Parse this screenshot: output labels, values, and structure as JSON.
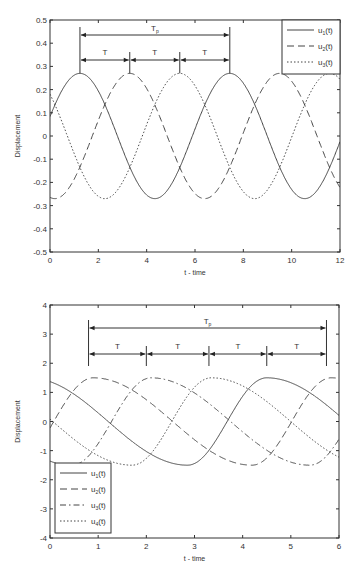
{
  "chart_data": [
    {
      "type": "line",
      "title": "",
      "xlabel": "t - time",
      "ylabel": "Displacement",
      "xlim": [
        0,
        12
      ],
      "ylim": [
        -0.5,
        0.5
      ],
      "xticks": [
        0,
        2,
        4,
        6,
        8,
        10,
        12
      ],
      "yticks": [
        -0.5,
        -0.4,
        -0.3,
        -0.2,
        -0.1,
        0,
        0.1,
        0.2,
        0.3,
        0.4,
        0.5
      ],
      "ytick_labels": [
        "-0.5",
        "-0.4",
        "-0.3",
        "-0.2",
        "-0.1",
        "0",
        "0.1",
        "0.2",
        "0.3",
        "0.4",
        "0.5"
      ],
      "grid": false,
      "legend_position": "upper right",
      "series": [
        {
          "name": "u1(t)",
          "sub": "1",
          "style": "solid",
          "amplitude": 0.27,
          "period": 6.2,
          "peak_t": 1.24
        },
        {
          "name": "u2(t)",
          "sub": "2",
          "style": "dashed",
          "amplitude": 0.27,
          "period": 6.2,
          "peak_t": 3.3
        },
        {
          "name": "u3(t)",
          "sub": "3",
          "style": "dotted",
          "amplitude": 0.27,
          "period": 6.2,
          "peak_t": 5.37
        }
      ],
      "annotations": {
        "Tp_label": "T",
        "Tp_sub": "p",
        "T_label": "T",
        "markers_t": [
          1.24,
          3.3,
          5.37,
          7.44
        ]
      }
    },
    {
      "type": "line",
      "title": "",
      "xlabel": "t - time",
      "ylabel": "Displacement",
      "xlim": [
        0,
        6
      ],
      "ylim": [
        -4,
        4
      ],
      "xticks": [
        0,
        1,
        2,
        3,
        4,
        5,
        6
      ],
      "yticks": [
        -4,
        -3,
        -2,
        -1,
        0,
        1,
        2,
        3,
        4
      ],
      "ytick_labels": [
        "-4",
        "-3",
        "-2",
        "-1",
        "0",
        "1",
        "2",
        "3",
        "4"
      ],
      "grid": false,
      "legend_position": "lower left",
      "series": [
        {
          "name": "u1(t)",
          "sub": "1",
          "style": "solid",
          "amplitude": 1.5,
          "period": 4.94,
          "peak_t": 4.5
        },
        {
          "name": "u2(t)",
          "sub": "2",
          "style": "dashed",
          "amplitude": 1.5,
          "period": 4.94,
          "peak_t": 0.9
        },
        {
          "name": "u3(t)",
          "sub": "3",
          "style": "dashdot",
          "amplitude": 1.5,
          "period": 4.94,
          "peak_t": 2.1
        },
        {
          "name": "u4(t)",
          "sub": "4",
          "style": "dotted",
          "amplitude": 1.5,
          "period": 4.94,
          "peak_t": 3.35
        }
      ],
      "annotations": {
        "Tp_label": "T",
        "Tp_sub": "p",
        "T_label": "T",
        "markers_t": [
          0.8,
          2.0,
          3.3,
          4.5,
          5.74
        ]
      }
    }
  ]
}
